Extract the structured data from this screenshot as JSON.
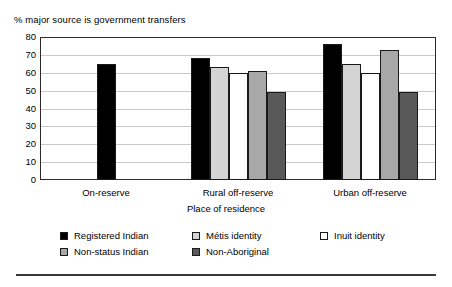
{
  "chart_data": {
    "type": "bar",
    "title": "% major source is government transfers",
    "xlabel": "Place of residence",
    "ylabel": "",
    "ylim": [
      0,
      80
    ],
    "yticks": [
      0,
      10,
      20,
      30,
      40,
      50,
      60,
      70,
      80
    ],
    "ytick_labels": [
      "0",
      "10",
      "20",
      "30",
      "40",
      "50",
      "60",
      "70",
      "80"
    ],
    "grid": true,
    "legend_position": "bottom",
    "categories": [
      "On-reserve",
      "Rural off-reserve",
      "Urban off-reserve"
    ],
    "series": [
      {
        "name": "Registered Indian",
        "color": "#000000",
        "values": [
          65,
          68,
          76
        ]
      },
      {
        "name": "Métis identity",
        "color": "#d4d4d4",
        "values": [
          null,
          63,
          65
        ]
      },
      {
        "name": "Inuit identity",
        "color": "#ffffff",
        "values": [
          null,
          60,
          60
        ]
      },
      {
        "name": "Non-status Indian",
        "color": "#a8a8a8",
        "values": [
          null,
          61,
          73
        ]
      },
      {
        "name": "Non-Aboriginal",
        "color": "#595959",
        "values": [
          null,
          49,
          49
        ]
      }
    ]
  },
  "legend": {
    "rows": [
      [
        {
          "label": "Registered Indian",
          "swatch": "#000000"
        },
        {
          "label": "Métis identity",
          "swatch": "#d4d4d4"
        },
        {
          "label": "Inuit identity",
          "swatch": "#ffffff"
        }
      ],
      [
        {
          "label": "Non-status Indian",
          "swatch": "#a8a8a8"
        },
        {
          "label": "Non-Aboriginal",
          "swatch": "#595959"
        }
      ]
    ]
  },
  "colors": {
    "frame": "#2b2b2b",
    "gridline": "#c9c9c9",
    "bar_border": "#1a1a1a",
    "rule": "#3a3a3a"
  }
}
